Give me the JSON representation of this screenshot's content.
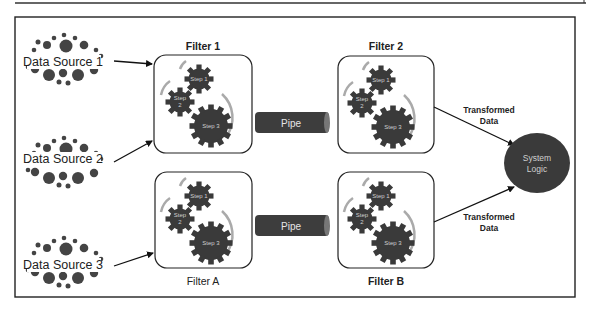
{
  "diagram": {
    "type": "pipe-and-filter architecture",
    "data_sources": [
      {
        "label": "Data Source 1"
      },
      {
        "label": "Data Source 2"
      },
      {
        "label": "Data Source 3"
      }
    ],
    "filters": [
      {
        "label": "Filter 1",
        "steps": [
          "Step 1",
          "Step 2",
          "Step 3"
        ]
      },
      {
        "label": "Filter 2",
        "steps": [
          "Step 1",
          "Step 2",
          "Step 3"
        ]
      },
      {
        "label": "Filter A",
        "steps": [
          "Step 1",
          "Step 2",
          "Step 3"
        ]
      },
      {
        "label": "Filter B",
        "steps": [
          "Step 1",
          "Step 2",
          "Step 3"
        ]
      }
    ],
    "pipes": [
      {
        "label": "Pipe",
        "from": "Filter 1",
        "to": "Filter 2"
      },
      {
        "label": "Pipe",
        "from": "Filter A",
        "to": "Filter B"
      }
    ],
    "step2_lines": [
      "Step",
      "2"
    ],
    "outputs": [
      {
        "line1": "Transformed",
        "line2": "Data",
        "from": "Filter 2"
      },
      {
        "line1": "Transformed",
        "line2": "Data",
        "from": "Filter B"
      }
    ],
    "sink": {
      "line1": "System",
      "line2": "Logic"
    },
    "colors": {
      "gear": "#3a3a3a",
      "pipe": "#3d3d3d",
      "arc": "#a8a8a8",
      "sink": "#3a3a3a",
      "frame": "#222222"
    }
  }
}
